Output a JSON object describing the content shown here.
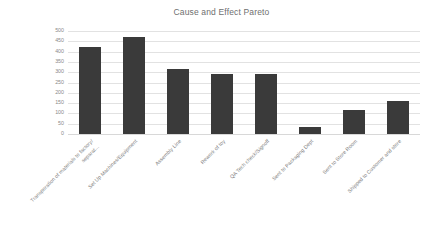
{
  "chart_data": {
    "type": "bar",
    "title": "Cause and Effect Pareto",
    "xlabel": "",
    "ylabel": "",
    "ylim": [
      0,
      500
    ],
    "ytick_step": 50,
    "yticks": [
      500,
      450,
      400,
      350,
      300,
      250,
      200,
      150,
      100,
      50,
      0
    ],
    "grid": true,
    "legend": "none",
    "bar_color": "#3a3a3a",
    "gridline_color": "#e2e2e2",
    "text_color": "#7c7c7c",
    "title_color": "#6f6f6f",
    "categories": [
      "Transporation of materials to factory/ separat...",
      "Set Up Machines/Equipment",
      "Assembly Line",
      "Rework of toy",
      "QA Tech check/Signoff",
      "Sent to Packaging Dept",
      "Sent to Store Room",
      "Shipped to Customer and store"
    ],
    "category_lines": [
      [
        "Transporation of materials to factory/",
        "separat..."
      ],
      [
        "Set Up Machines/Equipment",
        ""
      ],
      [
        "Assembly Line",
        ""
      ],
      [
        "Rework of toy",
        ""
      ],
      [
        "QA Tech check/Signoff",
        ""
      ],
      [
        "Sent to Packaging Dept",
        ""
      ],
      [
        "Sent to Store Room",
        ""
      ],
      [
        "Shipped to Customer and store",
        ""
      ]
    ],
    "values": [
      420,
      470,
      315,
      290,
      290,
      35,
      115,
      160
    ]
  }
}
